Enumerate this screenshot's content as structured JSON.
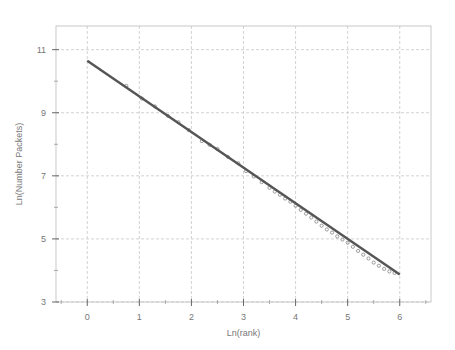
{
  "chart_data": {
    "type": "scatter",
    "title": "",
    "xlabel": "Ln(rank)",
    "ylabel": "Ln(Number Packets)",
    "xlim": [
      -0.6,
      6.6
    ],
    "ylim": [
      3,
      11.75
    ],
    "x_ticks": [
      0,
      1,
      2,
      3,
      4,
      5,
      6
    ],
    "x_tick_labels": [
      "0",
      "1",
      "2",
      "3",
      "4",
      "5",
      "6"
    ],
    "y_ticks": [
      3,
      5,
      7,
      9,
      11
    ],
    "y_tick_labels": [
      "3",
      "5",
      "7",
      "9",
      "11"
    ],
    "grid": true,
    "legend": "none",
    "series": [
      {
        "name": "fit",
        "kind": "line",
        "x": [
          0,
          6
        ],
        "y": [
          10.65,
          3.87
        ]
      },
      {
        "name": "observed",
        "kind": "scatter",
        "x": [
          0.75,
          1.05,
          1.3,
          1.55,
          1.75,
          1.95,
          2.2,
          2.35,
          2.5,
          2.7,
          2.9,
          3.05,
          3.2,
          3.35,
          3.5,
          3.6,
          3.7,
          3.8,
          3.9,
          4.0,
          4.1,
          4.2,
          4.3,
          4.4,
          4.5,
          4.6,
          4.7,
          4.8,
          4.9,
          5.0,
          5.1,
          5.2,
          5.3,
          5.4,
          5.5,
          5.6,
          5.7,
          5.8,
          5.9
        ],
        "y": [
          9.85,
          9.45,
          9.2,
          8.9,
          8.7,
          8.45,
          8.1,
          7.98,
          7.85,
          7.6,
          7.4,
          7.15,
          6.98,
          6.8,
          6.62,
          6.5,
          6.4,
          6.28,
          6.18,
          6.05,
          5.92,
          5.8,
          5.68,
          5.55,
          5.42,
          5.3,
          5.2,
          5.08,
          4.98,
          4.88,
          4.75,
          4.62,
          4.5,
          4.38,
          4.25,
          4.15,
          4.05,
          3.97,
          3.92
        ]
      }
    ]
  }
}
